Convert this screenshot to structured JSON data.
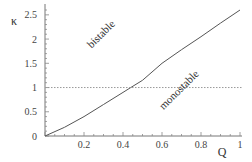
{
  "chart_data": {
    "type": "line",
    "title": "",
    "xlabel": "Q",
    "ylabel": "κ",
    "xlim": [
      0,
      1
    ],
    "ylim": [
      0,
      2.6
    ],
    "x_ticks": [
      "0.2",
      "0.4",
      "0.6",
      "0.8",
      "1"
    ],
    "x_tick_values": [
      0.2,
      0.4,
      0.6,
      0.8,
      1.0
    ],
    "y_ticks": [
      "0",
      "0.5",
      "1",
      "1.5",
      "2",
      "2.5"
    ],
    "y_tick_values": [
      0,
      0.5,
      1,
      1.5,
      2,
      2.5
    ],
    "grid": false,
    "series": [
      {
        "name": "boundary curve",
        "style": "solid",
        "color": "#555555",
        "x": [
          0,
          0.1,
          0.2,
          0.3,
          0.4,
          0.44,
          0.5,
          0.6,
          0.7,
          0.8,
          0.9,
          1.0
        ],
        "y": [
          0,
          0.18,
          0.4,
          0.65,
          0.9,
          1.0,
          1.15,
          1.5,
          1.78,
          2.05,
          2.33,
          2.6
        ]
      },
      {
        "name": "κ = 1 reference",
        "style": "dotted",
        "color": "#999999",
        "x": [
          0,
          1
        ],
        "y": [
          1,
          1
        ]
      }
    ],
    "annotations": [
      {
        "text": "bistable",
        "x": 0.3,
        "y": 2.05,
        "rotation": -45
      },
      {
        "text": "monostable",
        "x": 0.7,
        "y": 0.9,
        "rotation": -45
      }
    ]
  }
}
